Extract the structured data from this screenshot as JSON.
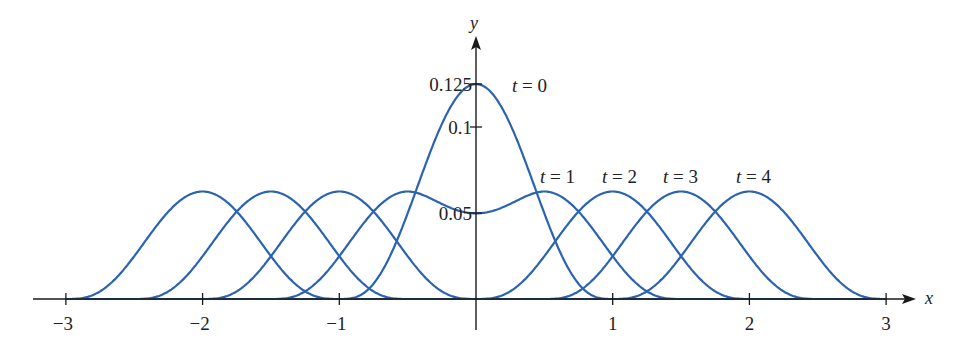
{
  "chart_data": {
    "type": "line",
    "title": "",
    "xlabel": "x",
    "ylabel": "y",
    "xlim": [
      -3,
      3
    ],
    "ylim": [
      0,
      0.125
    ],
    "grid": false,
    "x_ticks": [
      {
        "value": -3,
        "label": "−3"
      },
      {
        "value": -2,
        "label": "−2"
      },
      {
        "value": -1,
        "label": "−1"
      },
      {
        "value": 1,
        "label": "1"
      },
      {
        "value": 2,
        "label": "2"
      },
      {
        "value": 3,
        "label": "3"
      }
    ],
    "y_ticks": [
      {
        "value": 0.05,
        "label": "0.05"
      },
      {
        "value": 0.1,
        "label": "0.1"
      },
      {
        "value": 0.125,
        "label": "0.125"
      }
    ],
    "series": [
      {
        "name": "t = 0",
        "label": "t = 0",
        "peaks": [
          {
            "x": 0,
            "y": 0.125
          }
        ]
      },
      {
        "name": "t = 1",
        "label": "t = 1",
        "peaks": [
          {
            "x": -0.5,
            "y": 0.0625
          },
          {
            "x": 0.5,
            "y": 0.0625
          }
        ],
        "value_at_0": 0.049
      },
      {
        "name": "t = 2",
        "label": "t = 2",
        "peaks": [
          {
            "x": -1,
            "y": 0.0625
          },
          {
            "x": 1,
            "y": 0.0625
          }
        ]
      },
      {
        "name": "t = 3",
        "label": "t = 3",
        "peaks": [
          {
            "x": -1.5,
            "y": 0.0625
          },
          {
            "x": 1.5,
            "y": 0.0625
          }
        ]
      },
      {
        "name": "t = 4",
        "label": "t = 4",
        "peaks": [
          {
            "x": -2,
            "y": 0.0625
          },
          {
            "x": 2,
            "y": 0.0625
          }
        ]
      }
    ],
    "times": [
      0,
      1,
      2,
      3,
      4
    ],
    "peak_height": 0.125,
    "support_half_width": 1,
    "speed": 0.5
  },
  "style": {
    "curve_color": "#2b63b2",
    "axis_color": "#1a1a1a"
  },
  "labels": {
    "x_axis": "x",
    "y_axis": "y",
    "t0": "t = 0",
    "t1": "t = 1",
    "t2": "t = 2",
    "t3": "t = 3",
    "t4": "t = 4"
  }
}
